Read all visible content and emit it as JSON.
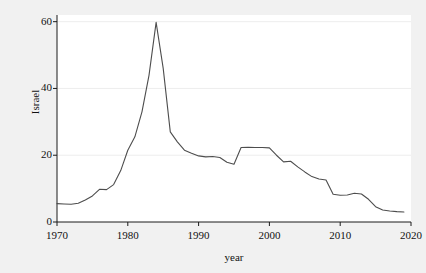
{
  "chart_data": {
    "type": "line",
    "title": "",
    "xlabel": "year",
    "ylabel": "Israel",
    "xlim": [
      1970,
      2020
    ],
    "ylim": [
      0,
      62
    ],
    "grid": true,
    "legend": "none",
    "xticks": [
      "1970",
      "1980",
      "1990",
      "2000",
      "2010",
      "2020"
    ],
    "xtick_values": [
      1970,
      1980,
      1990,
      2000,
      2010,
      2020
    ],
    "yticks": [
      "0",
      "20",
      "40",
      "60"
    ],
    "ytick_values": [
      0,
      20,
      40,
      60
    ],
    "line_color": "#4d4d4d",
    "panel_color": "#ffffff",
    "background_color": "#f1f1f1",
    "series": [
      {
        "name": "Israel",
        "x": [
          1970,
          1971,
          1972,
          1973,
          1974,
          1975,
          1976,
          1977,
          1978,
          1979,
          1980,
          1981,
          1982,
          1983,
          1984,
          1985,
          1986,
          1987,
          1988,
          1989,
          1990,
          1991,
          1992,
          1993,
          1994,
          1995,
          1996,
          1997,
          1998,
          1999,
          2000,
          2001,
          2002,
          2003,
          2004,
          2005,
          2006,
          2007,
          2008,
          2009,
          2010,
          2011,
          2012,
          2013,
          2014,
          2015,
          2016,
          2017,
          2018,
          2019
        ],
        "y": [
          5.5,
          5.4,
          5.3,
          5.6,
          6.6,
          7.8,
          9.8,
          9.7,
          11.2,
          15.4,
          21.5,
          25.5,
          33.0,
          44.0,
          59.8,
          46.0,
          27.0,
          24.0,
          21.5,
          20.6,
          19.8,
          19.5,
          19.6,
          19.3,
          17.9,
          17.3,
          22.3,
          22.4,
          22.3,
          22.3,
          22.2,
          20.0,
          18.0,
          18.2,
          16.5,
          15.0,
          13.6,
          12.9,
          12.6,
          8.3,
          8.0,
          8.1,
          8.6,
          8.4,
          6.8,
          4.6,
          3.6,
          3.3,
          3.1,
          3.0
        ]
      }
    ]
  }
}
